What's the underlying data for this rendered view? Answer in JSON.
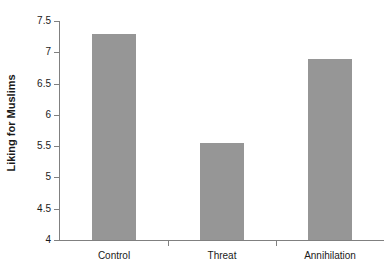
{
  "chart_data": {
    "type": "bar",
    "title": "",
    "xlabel": "",
    "ylabel": "Liking for Muslims",
    "categories": [
      "Control",
      "Threat",
      "Annihilation"
    ],
    "values": [
      7.3,
      5.55,
      6.9
    ],
    "ylim": [
      4,
      7.5
    ],
    "yticks": [
      4,
      4.5,
      5,
      5.5,
      6,
      6.5,
      7,
      7.5
    ],
    "ytick_labels": [
      "4",
      "4.5",
      "5",
      "5.5",
      "6",
      "6.5",
      "7",
      "7.5"
    ],
    "grid": false,
    "legend": false,
    "bar_color": "#969696",
    "axis_color": "#808080",
    "text_color": "#1a1a1a",
    "background": "#ffffff"
  }
}
